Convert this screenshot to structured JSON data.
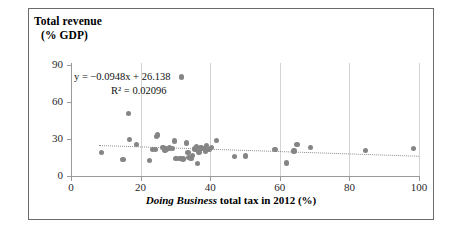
{
  "chart_data": {
    "type": "scatter",
    "title": "",
    "xlabel": "Doing Business total tax in 2012 (%)",
    "xlabel_italic_part": "Doing Business",
    "xlabel_rest": " total tax in 2012 (%)",
    "ylabel_line1": "Total revenue",
    "ylabel_line2": "(% GDP)",
    "ylabel": "Total revenue (% GDP)",
    "xlim": [
      0,
      100
    ],
    "ylim": [
      0,
      90
    ],
    "xticks": [
      "0",
      "20",
      "40",
      "60",
      "80",
      "100"
    ],
    "xtick_values": [
      0,
      20,
      40,
      60,
      80,
      100
    ],
    "yticks": [
      "0",
      "30",
      "60",
      "90"
    ],
    "ytick_values": [
      0,
      30,
      60,
      90
    ],
    "grid": "vertical-only",
    "legend": "none",
    "marker_color": "#858585",
    "trendline_color": "#8d8d8d",
    "trendline_style": "dotted",
    "equation": "y = −0.0948x + 26.138",
    "r_squared": "R² = 0.02096",
    "slope": -0.0948,
    "intercept": 26.138,
    "r2_value": 0.02096,
    "points": [
      [
        8.8,
        19.2
      ],
      [
        14.9,
        13.5
      ],
      [
        16.6,
        50.8
      ],
      [
        16.8,
        29.8
      ],
      [
        18.9,
        25.6
      ],
      [
        22.6,
        12.6
      ],
      [
        23.5,
        21.6
      ],
      [
        24.3,
        21.3
      ],
      [
        24.6,
        31.9
      ],
      [
        24.9,
        33.2
      ],
      [
        26.4,
        23.3
      ],
      [
        27.0,
        21.1
      ],
      [
        27.4,
        22.0
      ],
      [
        28.3,
        22.6
      ],
      [
        29.2,
        22.4
      ],
      [
        29.8,
        28.5
      ],
      [
        30.2,
        14.0
      ],
      [
        31.3,
        14.4
      ],
      [
        31.7,
        80.3
      ],
      [
        32.2,
        13.8
      ],
      [
        33.2,
        26.7
      ],
      [
        33.6,
        18.9
      ],
      [
        33.9,
        14.8
      ],
      [
        34.5,
        14.1
      ],
      [
        34.9,
        16.6
      ],
      [
        35.6,
        21.8
      ],
      [
        36.0,
        24.1
      ],
      [
        36.4,
        10.2
      ],
      [
        36.8,
        19.4
      ],
      [
        37.4,
        22.8
      ],
      [
        38.2,
        22.1
      ],
      [
        38.6,
        19.8
      ],
      [
        39.0,
        24.5
      ],
      [
        39.6,
        21.5
      ],
      [
        40.3,
        23.1
      ],
      [
        41.8,
        28.7
      ],
      [
        47.0,
        16.0
      ],
      [
        50.2,
        16.1
      ],
      [
        58.6,
        21.7
      ],
      [
        61.9,
        10.6
      ],
      [
        64.1,
        20.3
      ],
      [
        64.9,
        25.7
      ],
      [
        68.9,
        23.2
      ],
      [
        84.6,
        20.5
      ],
      [
        98.4,
        22.2
      ]
    ]
  }
}
